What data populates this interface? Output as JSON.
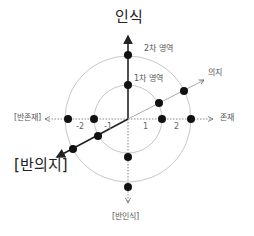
{
  "diagram": {
    "axes": {
      "up": "인식",
      "down": "[반인식]",
      "right": "존재",
      "left": "[반존재]",
      "diag_up": "의지",
      "diag_down": "[반의지]"
    },
    "rings": {
      "inner": "1차 영역",
      "outer": "2차 영역"
    },
    "ticks": {
      "pos1": "1",
      "pos2": "2",
      "neg1": "-1",
      "neg2": "-2"
    }
  }
}
